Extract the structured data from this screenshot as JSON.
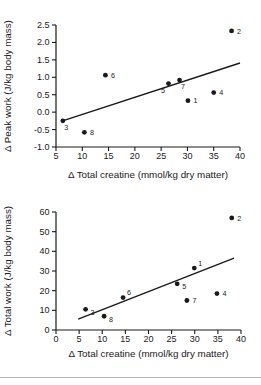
{
  "figure": {
    "background_color": "#ffffff",
    "ink_color": "#1a1a1a",
    "divider_color": "#b5b5b5"
  },
  "chart_data": [
    {
      "type": "scatter",
      "title": "",
      "xlabel": "Δ Total creatine (mmol/kg dry matter)",
      "ylabel": "Δ Peak work (J/kg body mass)",
      "xlim": [
        5,
        40
      ],
      "ylim": [
        -1.0,
        2.5
      ],
      "grid": false,
      "legend": false,
      "marker": "filled-circle",
      "marker_color": "#1a1a1a",
      "xticks": [
        {
          "v": 5,
          "label": "5"
        },
        {
          "v": 10,
          "label": "10"
        },
        {
          "v": 15,
          "label": "15"
        },
        {
          "v": 20,
          "label": "20"
        },
        {
          "v": 25,
          "label": "25"
        },
        {
          "v": 30,
          "label": "30"
        },
        {
          "v": 35,
          "label": "35"
        },
        {
          "v": 40,
          "label": "40"
        }
      ],
      "yticks": [
        {
          "v": 2.5,
          "label": "2.5"
        },
        {
          "v": 2.0,
          "label": "2.0"
        },
        {
          "v": 1.5,
          "label": "1.5"
        },
        {
          "v": 1.0,
          "label": "1.0"
        },
        {
          "v": 0.5,
          "label": "0.5"
        },
        {
          "v": 0.0,
          "label": "0.0"
        },
        {
          "v": -0.5,
          "label": "-0.5"
        },
        {
          "v": -1.0,
          "label": "-1.0"
        }
      ],
      "points": [
        {
          "label": "1",
          "x": 30.1,
          "y": 0.33,
          "label_pos": "right"
        },
        {
          "label": "2",
          "x": 38.4,
          "y": 2.33,
          "label_pos": "right"
        },
        {
          "label": "3",
          "x": 6.3,
          "y": -0.25,
          "label_pos": "below-right"
        },
        {
          "label": "4",
          "x": 35.0,
          "y": 0.56,
          "label_pos": "right"
        },
        {
          "label": "5",
          "x": 26.4,
          "y": 0.82,
          "label_pos": "below-left"
        },
        {
          "label": "6",
          "x": 14.4,
          "y": 1.06,
          "label_pos": "right"
        },
        {
          "label": "7",
          "x": 28.5,
          "y": 0.92,
          "label_pos": "below-right"
        },
        {
          "label": "8",
          "x": 10.4,
          "y": -0.58,
          "label_pos": "right"
        }
      ],
      "trend_line": {
        "x1": 6.1,
        "y1": -0.26,
        "x2": 40.0,
        "y2": 1.41
      }
    },
    {
      "type": "scatter",
      "title": "",
      "xlabel": "Δ Total creatine (mmol/kg dry matter)",
      "ylabel": "Δ Total work (J/kg body mass)",
      "xlim": [
        0,
        40
      ],
      "ylim": [
        0,
        60
      ],
      "grid": false,
      "legend": false,
      "marker": "filled-circle",
      "marker_color": "#1a1a1a",
      "xticks": [
        {
          "v": 0,
          "label": "0"
        },
        {
          "v": 5,
          "label": "5"
        },
        {
          "v": 10,
          "label": "10"
        },
        {
          "v": 15,
          "label": "15"
        },
        {
          "v": 20,
          "label": "20"
        },
        {
          "v": 25,
          "label": "25"
        },
        {
          "v": 30,
          "label": "30"
        },
        {
          "v": 35,
          "label": "35"
        },
        {
          "v": 40,
          "label": "40"
        }
      ],
      "yticks": [
        {
          "v": 60,
          "label": "60"
        },
        {
          "v": 50,
          "label": "50"
        },
        {
          "v": 40,
          "label": "40"
        },
        {
          "v": 30,
          "label": "30"
        },
        {
          "v": 20,
          "label": "20"
        },
        {
          "v": 10,
          "label": "10"
        },
        {
          "v": 0,
          "label": "0"
        }
      ],
      "points": [
        {
          "label": "1",
          "x": 29.9,
          "y": 31.5,
          "label_pos": "above-right"
        },
        {
          "label": "2",
          "x": 38.0,
          "y": 57.0,
          "label_pos": "right"
        },
        {
          "label": "3",
          "x": 6.4,
          "y": 10.5,
          "label_pos": "right-below"
        },
        {
          "label": "4",
          "x": 34.8,
          "y": 18.5,
          "label_pos": "right"
        },
        {
          "label": "5",
          "x": 26.2,
          "y": 23.5,
          "label_pos": "right-below"
        },
        {
          "label": "6",
          "x": 14.5,
          "y": 16.5,
          "label_pos": "above-right"
        },
        {
          "label": "7",
          "x": 28.3,
          "y": 15.0,
          "label_pos": "right"
        },
        {
          "label": "8",
          "x": 10.4,
          "y": 7.0,
          "label_pos": "right-below"
        }
      ],
      "trend_line": {
        "x1": 4.8,
        "y1": 5.5,
        "x2": 38.5,
        "y2": 36.5
      }
    }
  ]
}
